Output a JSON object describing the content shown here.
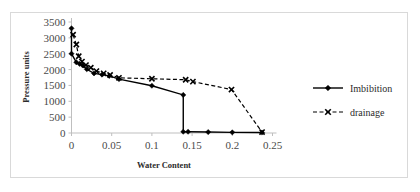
{
  "chart_data": {
    "type": "line",
    "title": "",
    "xlabel": "Water Content",
    "ylabel": "Pressure units",
    "xlim": [
      0,
      0.25
    ],
    "ylim": [
      0,
      3500
    ],
    "xticks": [
      "0",
      "0.05",
      "0.1",
      "0.15",
      "0.2",
      "0.25"
    ],
    "xtick_values": [
      0,
      0.05,
      0.1,
      0.15,
      0.2,
      0.25
    ],
    "yticks": [
      "0",
      "500",
      "1000",
      "1500",
      "2000",
      "2500",
      "3000",
      "3500"
    ],
    "ytick_values": [
      0,
      500,
      1000,
      1500,
      2000,
      2500,
      3000,
      3500
    ],
    "grid": false,
    "legend_position": "right",
    "series": [
      {
        "name": "Imbibition",
        "line_style": "solid",
        "marker": "diamond",
        "color": "#000000",
        "x": [
          0,
          0,
          0.006,
          0.01,
          0.014,
          0.019,
          0.028,
          0.038,
          0.047,
          0.059,
          0.1,
          0.139,
          0.139,
          0.145,
          0.17,
          0.2,
          0.237
        ],
        "y": [
          3300,
          2500,
          2230,
          2180,
          2130,
          2010,
          1880,
          1840,
          1800,
          1700,
          1490,
          1200,
          40,
          40,
          30,
          20,
          15
        ]
      },
      {
        "name": "drainage",
        "line_style": "dashed",
        "marker": "x",
        "color": "#000000",
        "x": [
          0.002,
          0.006,
          0.009,
          0.013,
          0.018,
          0.024,
          0.031,
          0.04,
          0.048,
          0.059,
          0.1,
          0.142,
          0.151,
          0.199,
          0.237
        ],
        "y": [
          3100,
          2790,
          2420,
          2250,
          2140,
          2060,
          1950,
          1880,
          1830,
          1740,
          1710,
          1680,
          1620,
          1370,
          30
        ]
      }
    ]
  },
  "legend": {
    "items": [
      {
        "label": "Imbibition"
      },
      {
        "label": "drainage"
      }
    ]
  },
  "axes": {
    "x_title": "Water Content",
    "y_title": "Pressure units"
  }
}
